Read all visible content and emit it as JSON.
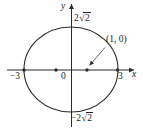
{
  "figure": {
    "background_color": "#ffffff",
    "line_color": "#2b2b2b",
    "text_color": "#1c1c1c"
  },
  "labels": {
    "y_axis": "y",
    "x_axis": "x",
    "origin": "0",
    "x_intercept_left": "−3",
    "x_intercept_right": "3",
    "focus_point": "(1, 0)",
    "y_intercept_top": {
      "coefficient": "2",
      "radical_sign": "√",
      "radicand": "2"
    },
    "y_intercept_bottom": {
      "coefficient": "−2",
      "radical_sign": "√",
      "radicand": "2"
    }
  },
  "figure_data": {
    "type": "ellipse-graph",
    "x_intercepts": [
      -3,
      3
    ],
    "y_intercept_labels": [
      "2√2",
      "−2√2"
    ],
    "marked_points_on_x_axis": [
      [
        -3,
        0
      ],
      [
        -1,
        0
      ],
      [
        1,
        0
      ],
      [
        3,
        0
      ]
    ],
    "annotated_point_label": "(1, 0)",
    "axes": {
      "x_label": "x",
      "y_label": "y",
      "origin_label": "0"
    }
  }
}
